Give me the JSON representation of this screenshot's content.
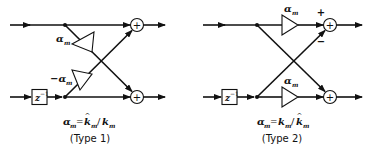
{
  "diagrams": [
    {
      "name": "type-1",
      "caption": "(Type 1)",
      "formula": "α_m = k̂_m / k_m",
      "formula_parts": {
        "lhs": "α",
        "lhs_sub": "m",
        "eq": "=",
        "num": "k",
        "num_sub": "m",
        "hat": "^",
        "slash": "/",
        "den": "k",
        "den_sub": "m"
      },
      "delay_label": "z",
      "delay_exp": "−1",
      "upper_gain": {
        "symbol": "α",
        "sub": "m"
      },
      "lower_gain": {
        "symbol": "−α",
        "sub": "m"
      },
      "sum_symbol": "+"
    },
    {
      "name": "type-2",
      "caption": "(Type 2)",
      "formula_parts": {
        "lhs": "α",
        "lhs_sub": "m",
        "eq": "=",
        "num": "k",
        "num_sub": "m",
        "slash": "/",
        "den": "k",
        "den_sub": "m",
        "hat": "^"
      },
      "delay_label": "z",
      "delay_exp": "−1",
      "upper_gain": {
        "symbol": "α",
        "sub": "m"
      },
      "lower_gain": {
        "symbol": "α",
        "sub": "m"
      },
      "sum_symbol": "+",
      "plus_sign": "+",
      "minus_sign": "−"
    }
  ]
}
